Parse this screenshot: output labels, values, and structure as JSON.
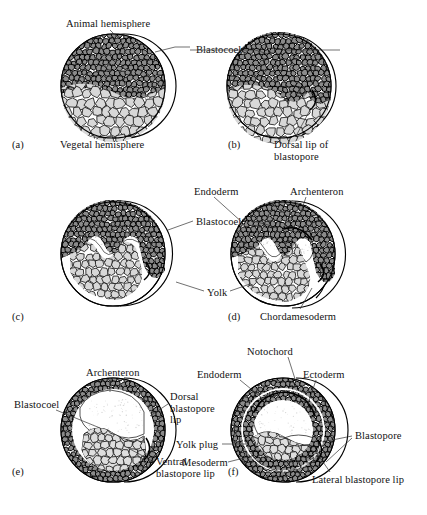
{
  "figure": {
    "type": "biological-diagram",
    "panel_count": 6
  },
  "colors": {
    "ink": "#121212",
    "leader": "#333333",
    "animal_cell_fill": "#8a8a8a",
    "animal_cell_stroke": "#000000",
    "vegetal_cell_fill": "#d8d8d8",
    "vegetal_cell_stroke": "#1a1a1a",
    "yolk_fill": "#dedede",
    "cavity_fill": "#ffffff",
    "background": "#ffffff"
  },
  "panels": [
    {
      "key": "a",
      "letter": "(a)",
      "stage": "blastula",
      "labels": [
        {
          "name": "animal-hemisphere",
          "text": "Animal hemisphere"
        },
        {
          "name": "vegetal-hemisphere",
          "text": "Vegetal hemisphere"
        }
      ]
    },
    {
      "key": "b",
      "letter": "(b)",
      "stage": "early gastrula, dorsal lip forms",
      "labels": [
        {
          "name": "blastocoel",
          "text": "Blastocoel"
        },
        {
          "name": "dorsal-lip-of-blastopore",
          "text": "Dorsal lip of\nblastopore"
        }
      ]
    },
    {
      "key": "c",
      "letter": "(c)",
      "stage": "invagination deepens",
      "labels": [
        {
          "name": "blastocoel",
          "text": "Blastocoel"
        }
      ]
    },
    {
      "key": "d",
      "letter": "(d)",
      "stage": "archenteron forms",
      "labels": [
        {
          "name": "endoderm",
          "text": "Endoderm"
        },
        {
          "name": "archenteron",
          "text": "Archenteron"
        },
        {
          "name": "yolk",
          "text": "Yolk"
        },
        {
          "name": "chordamesoderm",
          "text": "Chordamesoderm"
        }
      ]
    },
    {
      "key": "e",
      "stage": "late gastrula",
      "letter": "(e)",
      "labels": [
        {
          "name": "archenteron",
          "text": "Archenteron"
        },
        {
          "name": "blastocoel",
          "text": "Blastocoel"
        },
        {
          "name": "dorsal-blastopore-lip",
          "text": "Dorsal\nblastopore\nlip"
        },
        {
          "name": "ventral-blastopore-lip",
          "text": "Ventral\nblastopore lip"
        }
      ]
    },
    {
      "key": "f",
      "letter": "(f)",
      "stage": "yolk plug stage",
      "labels": [
        {
          "name": "notochord",
          "text": "Notochord"
        },
        {
          "name": "endoderm",
          "text": "Endoderm"
        },
        {
          "name": "ectoderm",
          "text": "Ectoderm"
        },
        {
          "name": "yolk-plug",
          "text": "Yolk plug"
        },
        {
          "name": "mesoderm",
          "text": "Mesoderm"
        },
        {
          "name": "blastopore",
          "text": "Blastopore"
        },
        {
          "name": "lateral-blastopore-lip",
          "text": "Lateral blastopore lip"
        }
      ]
    }
  ],
  "label_text": {
    "animal_hemisphere": "Animal hemisphere",
    "vegetal_hemisphere": "Vegetal hemisphere",
    "blastocoel": "Blastocoel",
    "dorsal_lip_line1": "Dorsal lip of",
    "dorsal_lip_line2": "blastopore",
    "endoderm": "Endoderm",
    "archenteron": "Archenteron",
    "yolk": "Yolk",
    "chordamesoderm": "Chordamesoderm",
    "dorsal_bl_line1": "Dorsal",
    "dorsal_bl_line2": "blastopore",
    "dorsal_bl_line3": "lip",
    "ventral_line1": "Ventral",
    "ventral_line2": "blastopore lip",
    "notochord": "Notochord",
    "ectoderm": "Ectoderm",
    "yolk_plug": "Yolk plug",
    "mesoderm": "Mesoderm",
    "blastopore": "Blastopore",
    "lateral_lip": "Lateral blastopore lip",
    "letter_a": "(a)",
    "letter_b": "(b)",
    "letter_c": "(c)",
    "letter_d": "(d)",
    "letter_e": "(e)",
    "letter_f": "(f)"
  }
}
